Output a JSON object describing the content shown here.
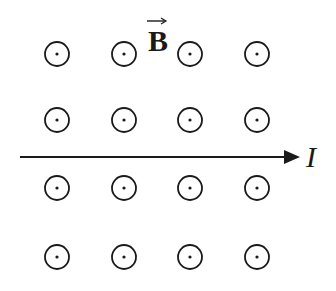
{
  "diagram": {
    "field_label": "B",
    "field_symbol": "vector-arrow-over-B",
    "current_label": "I",
    "field_direction": "out-of-page",
    "grid": {
      "rows": 4,
      "cols": 4,
      "col_x": [
        57,
        124,
        190,
        257
      ],
      "row_y": [
        54,
        120,
        188,
        257
      ],
      "radius": 12
    },
    "wire": {
      "x1": 20,
      "x2": 300,
      "y": 157,
      "direction": "right"
    },
    "colors": {
      "stroke": "#1a1a1a",
      "background": "#ffffff"
    }
  }
}
